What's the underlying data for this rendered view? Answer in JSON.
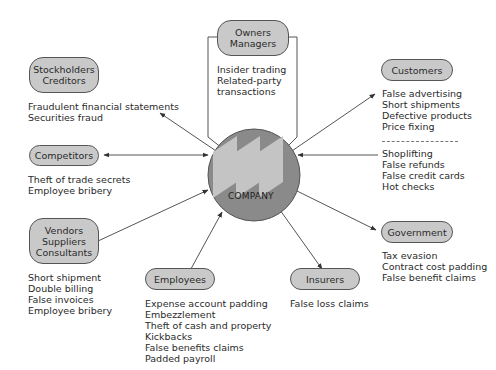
{
  "center": {
    "label": "COMPANY"
  },
  "nodes": {
    "owners": {
      "lines": [
        "Owners",
        "Managers"
      ],
      "items": [
        "Insider trading",
        "Related-party",
        "transactions"
      ]
    },
    "stockholders": {
      "lines": [
        "Stockholders",
        "Creditors"
      ],
      "items": [
        "Fraudulent financial statements",
        "Securities fraud"
      ]
    },
    "competitors": {
      "lines": [
        "Competitors"
      ],
      "items": [
        "Theft of trade secrets",
        "Employee bribery"
      ]
    },
    "vendors": {
      "lines": [
        "Vendors",
        "Suppliers",
        "Consultants"
      ],
      "items": [
        "Short shipment",
        "Double billing",
        "False invoices",
        "Employee bribery"
      ]
    },
    "employees": {
      "lines": [
        "Employees"
      ],
      "items": [
        "Expense account padding",
        "Embezzlement",
        "Theft of cash and property",
        "Kickbacks",
        "False benefits claims",
        "Padded payroll"
      ]
    },
    "insurers": {
      "lines": [
        "Insurers"
      ],
      "items": [
        "False loss claims"
      ]
    },
    "government": {
      "lines": [
        "Government"
      ],
      "items": [
        "Tax evasion",
        "Contract cost padding",
        "False benefit claims"
      ]
    },
    "customers": {
      "lines": [
        "Customers"
      ],
      "items_against_customers": [
        "False advertising",
        "Short shipments",
        "Defective products",
        "Price fixing"
      ],
      "items_by_customers": [
        "Shoplifting",
        "False refunds",
        "False credit cards",
        "Hot checks"
      ]
    }
  },
  "colors": {
    "pill_fill": "#c9c9c9",
    "circle_fill": "#8a8a8a",
    "logo_fill": "#c4c4c4",
    "line": "#444444"
  }
}
